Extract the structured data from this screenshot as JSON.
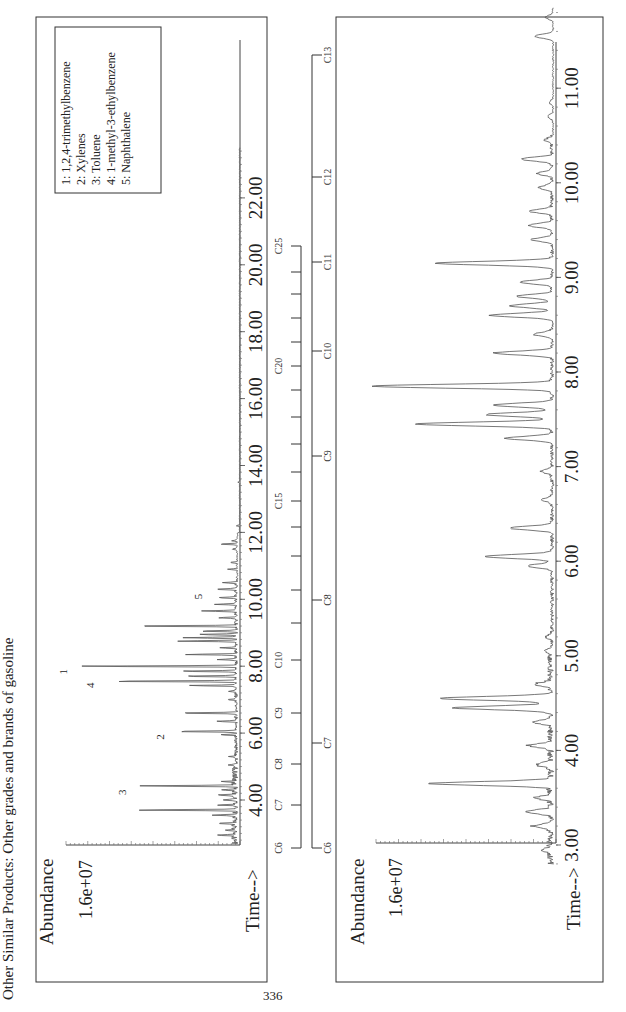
{
  "page": {
    "heading": "Other Similar Products:  Other grades and brands of gasoline",
    "page_number": "336"
  },
  "colors": {
    "trace": "#555555",
    "frame": "#333333",
    "text": "#222222"
  },
  "chart_data": [
    {
      "type": "line",
      "title": "Gasoline chromatogram (full range)",
      "ylabel": "Abundance",
      "xlabel": "Time-->",
      "y_tick_label": "1.6e+07",
      "x_ticks": [
        "4.00",
        "6.00",
        "8.00",
        "10.00",
        "12.00",
        "14.00",
        "16.00",
        "18.00",
        "20.00",
        "22.00"
      ],
      "xlim": [
        2.7,
        23.5
      ],
      "grid": false,
      "legend_position": "upper-right",
      "legend": [
        "1:  1,2,4-trimethylbenzene",
        "2:  Xylenes",
        "3:  Toluene",
        "4:  1-methyl-3-ethylbenzene",
        "5:  Naphthalene"
      ],
      "peak_labels": [
        {
          "label": "1",
          "time": 7.95,
          "rel_height": 0.9
        },
        {
          "label": "2",
          "time": 6.0,
          "rel_height": 0.36
        },
        {
          "label": "3",
          "time": 4.35,
          "rel_height": 0.57
        },
        {
          "label": "4",
          "time": 7.55,
          "rel_height": 0.75
        },
        {
          "label": "5",
          "time": 10.2,
          "rel_height": 0.15
        }
      ],
      "peaks": [
        [
          2.95,
          0.1
        ],
        [
          3.1,
          0.07
        ],
        [
          3.3,
          0.09
        ],
        [
          3.55,
          0.14
        ],
        [
          3.7,
          0.58
        ],
        [
          3.85,
          0.1
        ],
        [
          4.0,
          0.08
        ],
        [
          4.15,
          0.12
        ],
        [
          4.3,
          0.07
        ],
        [
          4.42,
          0.55
        ],
        [
          4.55,
          0.08
        ],
        [
          5.05,
          0.05
        ],
        [
          5.3,
          0.04
        ],
        [
          5.95,
          0.09
        ],
        [
          6.05,
          0.36
        ],
        [
          6.35,
          0.11
        ],
        [
          6.6,
          0.33
        ],
        [
          7.0,
          0.05
        ],
        [
          7.25,
          0.05
        ],
        [
          7.42,
          0.27
        ],
        [
          7.55,
          0.75
        ],
        [
          7.7,
          0.3
        ],
        [
          7.85,
          0.33
        ],
        [
          8.0,
          0.9
        ],
        [
          8.2,
          0.1
        ],
        [
          8.35,
          0.29
        ],
        [
          8.55,
          0.1
        ],
        [
          8.75,
          0.33
        ],
        [
          8.85,
          0.3
        ],
        [
          8.95,
          0.22
        ],
        [
          9.05,
          0.2
        ],
        [
          9.2,
          0.61
        ],
        [
          9.45,
          0.1
        ],
        [
          9.65,
          0.2
        ],
        [
          9.85,
          0.12
        ],
        [
          10.05,
          0.1
        ],
        [
          10.3,
          0.12
        ],
        [
          10.5,
          0.08
        ],
        [
          10.9,
          0.05
        ],
        [
          11.1,
          0.04
        ],
        [
          11.5,
          0.03
        ],
        [
          11.65,
          0.1
        ],
        [
          11.75,
          0.03
        ],
        [
          12.2,
          0.02
        ],
        [
          13.5,
          0.01
        ]
      ]
    },
    {
      "type": "line",
      "title": "Gasoline chromatogram (expanded 3–12 min)",
      "ylabel": "Abundance",
      "xlabel": "Time-->",
      "y_tick_label": "1.6e+07",
      "x_ticks": [
        "3.00",
        "4.00",
        "5.00",
        "6.00",
        "7.00",
        "8.00",
        "9.00",
        "10.00",
        "11.00"
      ],
      "xlim": [
        2.8,
        11.9
      ],
      "grid": false,
      "peaks": [
        [
          2.95,
          0.05
        ],
        [
          3.2,
          0.1
        ],
        [
          3.35,
          0.14
        ],
        [
          3.5,
          0.08
        ],
        [
          3.65,
          0.66
        ],
        [
          3.85,
          0.08
        ],
        [
          4.05,
          0.12
        ],
        [
          4.3,
          0.09
        ],
        [
          4.45,
          0.52
        ],
        [
          4.55,
          0.61
        ],
        [
          4.7,
          0.08
        ],
        [
          5.05,
          0.04
        ],
        [
          5.2,
          0.03
        ],
        [
          5.95,
          0.13
        ],
        [
          6.05,
          0.37
        ],
        [
          6.35,
          0.23
        ],
        [
          6.65,
          0.05
        ],
        [
          6.95,
          0.06
        ],
        [
          7.3,
          0.25
        ],
        [
          7.45,
          0.74
        ],
        [
          7.55,
          0.36
        ],
        [
          7.65,
          0.32
        ],
        [
          7.85,
          0.99
        ],
        [
          8.2,
          0.32
        ],
        [
          8.4,
          0.1
        ],
        [
          8.6,
          0.34
        ],
        [
          8.7,
          0.23
        ],
        [
          8.8,
          0.19
        ],
        [
          8.95,
          0.17
        ],
        [
          9.15,
          0.63
        ],
        [
          9.4,
          0.11
        ],
        [
          9.55,
          0.13
        ],
        [
          9.7,
          0.12
        ],
        [
          9.95,
          0.07
        ],
        [
          10.1,
          0.08
        ],
        [
          10.25,
          0.17
        ],
        [
          10.45,
          0.04
        ],
        [
          10.7,
          0.03
        ],
        [
          10.85,
          0.02
        ],
        [
          11.55,
          0.1
        ],
        [
          11.75,
          0.04
        ]
      ]
    }
  ],
  "carbon_scales": [
    {
      "name": "top-chart-carbon-scale",
      "labels": [
        "C6",
        "C7",
        "C8",
        "C9",
        "C10",
        "C15",
        "C20",
        "C25"
      ]
    },
    {
      "name": "bottom-chart-carbon-scale",
      "labels": [
        "C6",
        "C7",
        "C8",
        "C9",
        "C10",
        "C11",
        "C12",
        "C13"
      ]
    }
  ]
}
